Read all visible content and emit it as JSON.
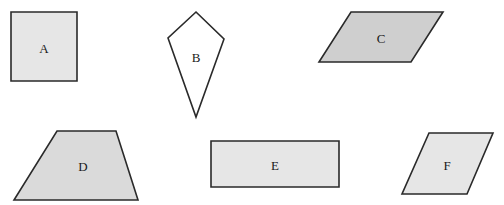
{
  "shapes": [
    {
      "id": "A",
      "label": "A",
      "type": "square",
      "fill": "#e6e6e6"
    },
    {
      "id": "B",
      "label": "B",
      "type": "kite",
      "fill": "#ffffff"
    },
    {
      "id": "C",
      "label": "C",
      "type": "parallelogram",
      "fill": "#cfcfcf"
    },
    {
      "id": "D",
      "label": "D",
      "type": "trapezoid",
      "fill": "#dadada"
    },
    {
      "id": "E",
      "label": "E",
      "type": "rectangle",
      "fill": "#e6e6e6"
    },
    {
      "id": "F",
      "label": "F",
      "type": "rhombus",
      "fill": "#e6e6e6"
    }
  ]
}
